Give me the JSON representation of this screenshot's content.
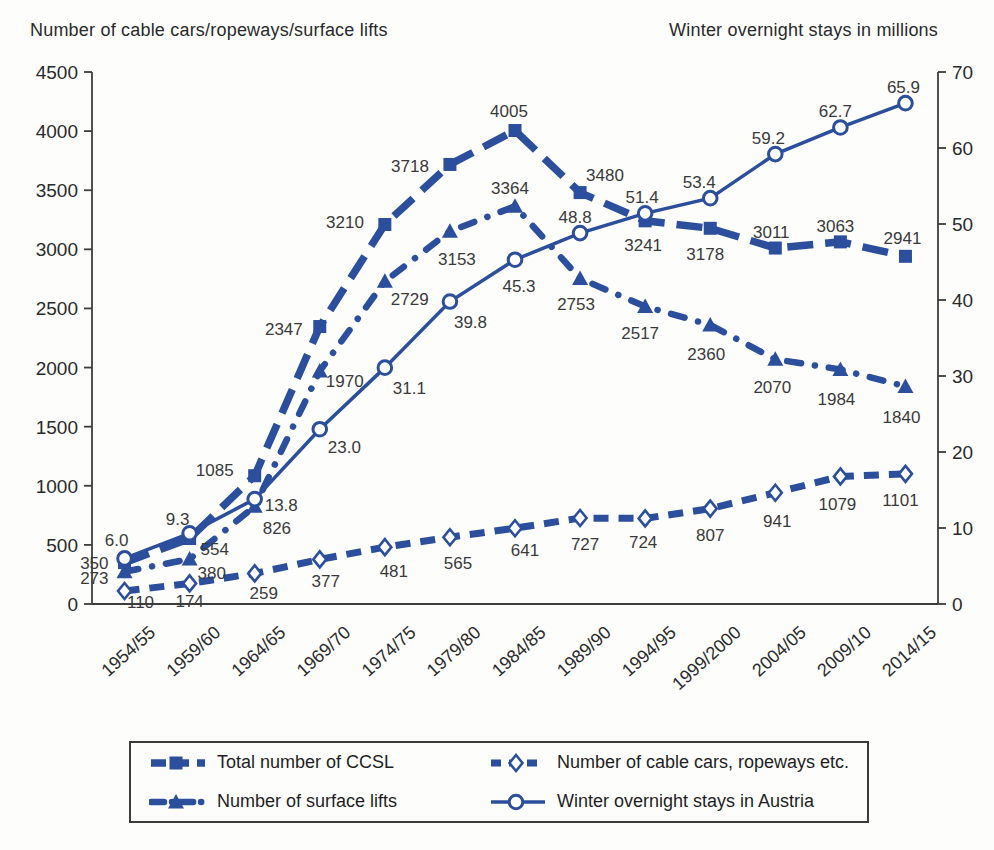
{
  "page": {
    "left_axis_title": "Number of cable cars/ropeways/surface lifts",
    "right_axis_title": "Winter overnight stays in millions"
  },
  "colors": {
    "series_blue": "#2b4f9c",
    "axis_line": "#3d3d3d",
    "text": "#2a2a2a",
    "data_label": "#3a3a3a",
    "background": "#fdfdfc"
  },
  "chart_data": {
    "type": "line",
    "categories": [
      "1954/55",
      "1959/60",
      "1964/65",
      "1969/70",
      "1974/75",
      "1979/80",
      "1984/85",
      "1989/90",
      "1994/95",
      "1999/2000",
      "2004/05",
      "2009/10",
      "2014/15"
    ],
    "left_axis": {
      "title": "Number of cable cars/ropeways/surface lifts",
      "min": 0,
      "max": 4500,
      "ticks": [
        0,
        500,
        1000,
        1500,
        2000,
        2500,
        3000,
        3500,
        4000,
        4500
      ]
    },
    "right_axis": {
      "title": "Winter overnight stays in millions",
      "min": 0,
      "max": 70,
      "ticks": [
        0,
        10,
        20,
        30,
        40,
        50,
        60,
        70
      ]
    },
    "grid": "off",
    "legend_position": "bottom",
    "series": [
      {
        "id": "total-ccsl",
        "name": "Total number of CCSL",
        "axis": "left",
        "line": "long-dash",
        "marker": "filled-square",
        "values": [
          350,
          554,
          1085,
          2347,
          3210,
          3718,
          4005,
          3480,
          3241,
          3178,
          3011,
          3063,
          2941
        ],
        "labels": [
          "350",
          "554",
          "1085",
          "2347",
          "3210",
          "3718",
          "4005",
          "3480",
          "3241",
          "3178",
          "3011",
          "3063",
          "2941"
        ],
        "label_pos": [
          [
            -16,
            6,
            "e"
          ],
          [
            11,
            16,
            "s"
          ],
          [
            -21,
            0,
            "e"
          ],
          [
            -17,
            8,
            "e"
          ],
          [
            -21,
            3,
            "e"
          ],
          [
            -21,
            8,
            "e"
          ],
          [
            -6,
            -14,
            "m"
          ],
          [
            6,
            -12,
            "s"
          ],
          [
            -2,
            30,
            "m"
          ],
          [
            -5,
            32,
            "m"
          ],
          [
            -4,
            -10,
            "m"
          ],
          [
            -5,
            -10,
            "m"
          ],
          [
            -3,
            -12,
            "m"
          ]
        ]
      },
      {
        "id": "cable-cars",
        "name": "Number of cable cars, ropeways etc.",
        "axis": "left",
        "line": "dash",
        "marker": "open-diamond",
        "values": [
          110,
          174,
          259,
          377,
          481,
          565,
          641,
          727,
          724,
          807,
          941,
          1079,
          1101
        ],
        "labels": [
          "110",
          "174",
          "259",
          "377",
          "481",
          "565",
          "641",
          "727",
          "724",
          "807",
          "941",
          "1079",
          "1101"
        ],
        "label_pos": [
          [
            16,
            17,
            "m"
          ],
          [
            0,
            24,
            "m"
          ],
          [
            9,
            26,
            "m"
          ],
          [
            6,
            28,
            "m"
          ],
          [
            9,
            30,
            "m"
          ],
          [
            8,
            32,
            "m"
          ],
          [
            10,
            28,
            "m"
          ],
          [
            5,
            32,
            "m"
          ],
          [
            -2,
            30,
            "m"
          ],
          [
            0,
            32,
            "m"
          ],
          [
            2,
            34,
            "m"
          ],
          [
            -3,
            34,
            "m"
          ],
          [
            -5,
            32,
            "m"
          ]
        ]
      },
      {
        "id": "surface-lifts",
        "name": "Number of surface lifts",
        "axis": "left",
        "line": "dash-dot",
        "marker": "filled-triangle",
        "values": [
          273,
          380,
          826,
          1970,
          2729,
          3153,
          3364,
          2753,
          2517,
          2360,
          2070,
          1984,
          1840
        ],
        "labels": [
          "273",
          "380",
          "826",
          "1970",
          "2729",
          "3153",
          "3364",
          "2753",
          "2517",
          "2360",
          "2070",
          "1984",
          "1840"
        ],
        "label_pos": [
          [
            -16,
            12,
            "e"
          ],
          [
            8,
            20,
            "s"
          ],
          [
            8,
            28,
            "s"
          ],
          [
            6,
            16,
            "s"
          ],
          [
            6,
            24,
            "s"
          ],
          [
            7,
            34,
            "m"
          ],
          [
            -5,
            -12,
            "m"
          ],
          [
            -4,
            31,
            "m"
          ],
          [
            -5,
            33,
            "m"
          ],
          [
            -4,
            35,
            "m"
          ],
          [
            -3,
            34,
            "m"
          ],
          [
            -4,
            36,
            "m"
          ],
          [
            -4,
            37,
            "m"
          ]
        ]
      },
      {
        "id": "overnight-stays",
        "name": "Winter overnight stays in Austria",
        "axis": "right",
        "line": "solid",
        "marker": "open-circle",
        "values": [
          6.0,
          9.3,
          13.8,
          23.0,
          31.1,
          39.8,
          45.3,
          48.8,
          51.4,
          53.4,
          59.2,
          62.7,
          65.9
        ],
        "labels": [
          "6.0",
          "9.3",
          "13.8",
          "23.0",
          "31.1",
          "39.8",
          "45.3",
          "48.8",
          "51.4",
          "53.4",
          "59.2",
          "62.7",
          "65.9"
        ],
        "label_pos": [
          [
            -8,
            -12,
            "m"
          ],
          [
            -12,
            -8,
            "m"
          ],
          [
            10,
            12,
            "s"
          ],
          [
            8,
            24,
            "s"
          ],
          [
            8,
            26,
            "s"
          ],
          [
            4,
            26,
            "s"
          ],
          [
            4,
            32,
            "m"
          ],
          [
            -5,
            -10,
            "m"
          ],
          [
            -3,
            -10,
            "m"
          ],
          [
            -11,
            -10,
            "m"
          ],
          [
            -7,
            -10,
            "m"
          ],
          [
            -5,
            -10,
            "m"
          ],
          [
            -2,
            -10,
            "m"
          ]
        ]
      }
    ],
    "legend": {
      "items": [
        "Total number of CCSL",
        "Number of cable cars, ropeways etc.",
        "Number of surface lifts",
        "Winter overnight stays in Austria"
      ]
    }
  }
}
